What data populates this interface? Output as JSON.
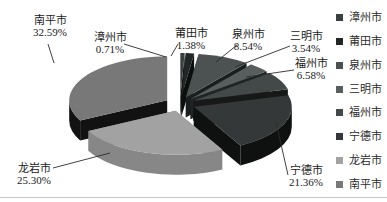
{
  "figure": {
    "background": "#ffffff",
    "bottom_rule_color": "#c6c6c6",
    "callout_line_color": "#2b2b2b",
    "label_text_color": "#1a1a1a"
  },
  "chart_data": {
    "type": "pie",
    "style": "3d-exploded",
    "start_angle_deg": 0,
    "direction": "clockwise",
    "unit": "%",
    "title": "",
    "slices": [
      {
        "label": "漳州市",
        "value": 0.71,
        "display": "0.71%",
        "color": "#3a3f3f",
        "side_color": "#131515"
      },
      {
        "label": "莆田市",
        "value": 1.38,
        "display": "1.38%",
        "color": "#222626",
        "side_color": "#0d0e0e"
      },
      {
        "label": "泉州市",
        "value": 8.54,
        "display": "8.54%",
        "color": "#4c5151",
        "side_color": "#1b1e1e"
      },
      {
        "label": "三明市",
        "value": 3.54,
        "display": "3.54%",
        "color": "#585d5d",
        "side_color": "#212424"
      },
      {
        "label": "福州市",
        "value": 6.58,
        "display": "6.58%",
        "color": "#434848",
        "side_color": "#171919"
      },
      {
        "label": "宁德市",
        "value": 21.36,
        "display": "21.36%",
        "color": "#343838",
        "side_color": "#0f1010"
      },
      {
        "label": "龙岩市",
        "value": 25.3,
        "display": "25.30%",
        "color": "#a2a2a2",
        "side_color": "#878787"
      },
      {
        "label": "南平市",
        "value": 32.59,
        "display": "32.59%",
        "color": "#787878",
        "side_color": "#121212"
      }
    ],
    "legend": {
      "position": "right",
      "items": [
        "漳州市",
        "莆田市",
        "泉州市",
        "三明市",
        "福州市",
        "宁德市",
        "龙岩市",
        "南平市"
      ]
    }
  }
}
